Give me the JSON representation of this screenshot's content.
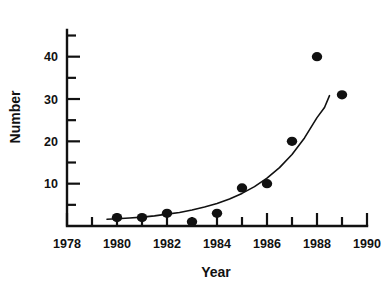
{
  "chart_data": {
    "type": "scatter",
    "title": "",
    "xlabel": "Year",
    "ylabel": "Number",
    "xlim": [
      1978,
      1990
    ],
    "ylim": [
      0,
      47
    ],
    "grid": false,
    "legend": null,
    "x": [
      1980,
      1981,
      1982,
      1983,
      1984,
      1985,
      1986,
      1987,
      1988,
      1989
    ],
    "values": [
      2,
      2,
      3,
      1,
      3,
      9,
      10,
      20,
      40,
      31
    ],
    "points": [
      {
        "x": 1980,
        "y": 2
      },
      {
        "x": 1981,
        "y": 2
      },
      {
        "x": 1982,
        "y": 3
      },
      {
        "x": 1983,
        "y": 1
      },
      {
        "x": 1984,
        "y": 3
      },
      {
        "x": 1985,
        "y": 9
      },
      {
        "x": 1986,
        "y": 10
      },
      {
        "x": 1987,
        "y": 20
      },
      {
        "x": 1988,
        "y": 40
      },
      {
        "x": 1989,
        "y": 31
      }
    ],
    "fit_curve": {
      "label": "exponential fit",
      "x": [
        1979.6,
        1980.0,
        1980.5,
        1981.0,
        1981.5,
        1982.0,
        1982.5,
        1983.0,
        1983.5,
        1984.0,
        1984.5,
        1985.0,
        1985.5,
        1986.0,
        1986.5,
        1987.0,
        1987.5,
        1988.0,
        1988.3,
        1988.5
      ],
      "y": [
        1.6,
        1.7,
        1.9,
        2.1,
        2.4,
        2.8,
        3.2,
        3.8,
        4.5,
        5.3,
        6.4,
        7.7,
        9.3,
        11.3,
        13.8,
        16.9,
        20.8,
        25.6,
        28.0,
        30.8
      ]
    },
    "x_ticks_major": [
      1978,
      1980,
      1982,
      1984,
      1986,
      1988,
      1990
    ],
    "x_ticks_minor": [
      1979,
      1981,
      1983,
      1985,
      1987,
      1989
    ],
    "x_ticklabels": [
      "1978",
      "1980",
      "1982",
      "1984",
      "1986",
      "1988",
      "1990"
    ],
    "y_ticks_major": [
      10,
      20,
      30,
      40
    ],
    "y_ticks_minor": [
      5,
      15,
      25,
      35,
      45
    ],
    "y_ticklabels": [
      "10",
      "20",
      "30",
      "40"
    ],
    "colors": {
      "ink": "#111111",
      "background": "#ffffff"
    }
  }
}
